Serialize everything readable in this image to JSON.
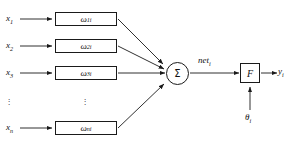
{
  "diagram": {
    "type": "neural-network-node",
    "stroke_color": "#1a1a1a",
    "background_color": "#ffffff",
    "inputs": [
      {
        "label": "x",
        "subscript": "1"
      },
      {
        "label": "x",
        "subscript": "2"
      },
      {
        "label": "x",
        "subscript": "3"
      },
      {
        "label": "x",
        "subscript": "n"
      }
    ],
    "weights": [
      {
        "label": "ω",
        "subscript": "1i"
      },
      {
        "label": "ω",
        "subscript": "2i"
      },
      {
        "label": "ω",
        "subscript": "3i"
      },
      {
        "label": "ω",
        "subscript": "ni"
      }
    ],
    "summation": {
      "symbol": "Σ",
      "output_label": "net",
      "output_subscript": "i"
    },
    "activation": {
      "symbol": "F"
    },
    "bias": {
      "label": "θ",
      "subscript": "i"
    },
    "output": {
      "label": "y",
      "subscript": "i"
    },
    "ellipsis": {
      "glyph": "⋮",
      "input_column": "⋮",
      "weight_column": "⋮"
    }
  }
}
